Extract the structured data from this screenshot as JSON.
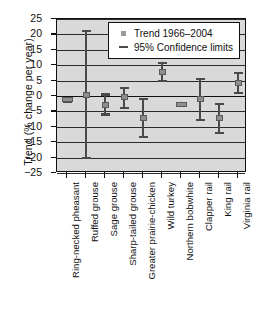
{
  "chart_data": {
    "type": "scatter",
    "title": "",
    "xlabel": "",
    "ylabel": "Trend (% change per year)",
    "ylim": [
      -25,
      25
    ],
    "yticks": [
      25,
      20,
      15,
      10,
      5,
      0,
      -5,
      -10,
      -15,
      -20,
      -25
    ],
    "ytick_labels": [
      "25",
      "20",
      "15",
      "10",
      "5",
      "0",
      "−5",
      "−10",
      "−15",
      "−20",
      "−25"
    ],
    "grid": true,
    "legend_position": "top-right",
    "legend": [
      {
        "marker": "square",
        "label": "Trend 1966–2004"
      },
      {
        "marker": "dash",
        "label": "95% Confidence limits"
      }
    ],
    "categories": [
      "Ring-necked pheasant",
      "Ruffed grouse",
      "Sage grouse",
      "Sharp-tailed grouse",
      "Greater prairie-chicken",
      "Wild turkey",
      "Northern bobwhite",
      "Clapper rail",
      "King rail",
      "Virginia rail"
    ],
    "series": [
      {
        "name": "Trend 1966–2004",
        "values": [
          -1.3,
          0.3,
          -3.0,
          -0.3,
          -7.0,
          7.8,
          -2.8,
          -1.0,
          -7.0,
          4.3
        ]
      }
    ],
    "error_bars": {
      "name": "95% Confidence limits",
      "lower": [
        -1.8,
        -20.0,
        -6.0,
        -4.0,
        -13.3,
        5.0,
        -3.2,
        -7.8,
        -12.0,
        1.0
      ],
      "upper": [
        -0.8,
        21.0,
        0.5,
        2.5,
        -1.0,
        10.8,
        -2.4,
        5.5,
        -2.5,
        7.5
      ]
    }
  }
}
